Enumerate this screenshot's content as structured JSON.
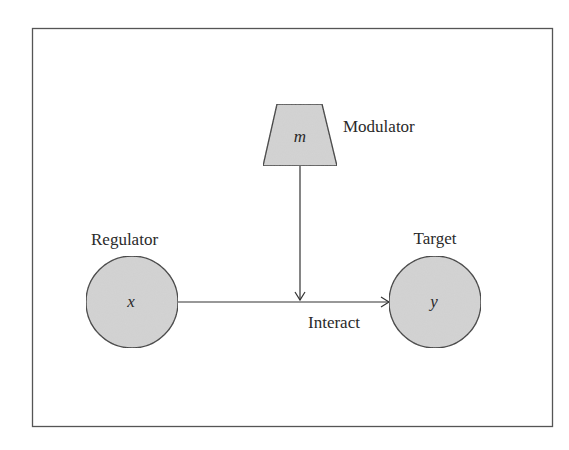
{
  "diagram": {
    "nodes": {
      "regulator": {
        "label": "Regulator",
        "symbol": "x",
        "shape": "circle"
      },
      "target": {
        "label": "Target",
        "symbol": "y",
        "shape": "circle"
      },
      "modulator": {
        "label": "Modulator",
        "symbol": "m",
        "shape": "trapezoid"
      }
    },
    "edges": {
      "interaction": {
        "label": "Interact",
        "from": "regulator",
        "to": "target"
      },
      "modulation": {
        "from": "modulator",
        "to": "interaction"
      }
    },
    "colors": {
      "node_fill": "#d4d4d4",
      "stroke": "#333333",
      "frame": "#555555",
      "background": "#ffffff"
    }
  }
}
